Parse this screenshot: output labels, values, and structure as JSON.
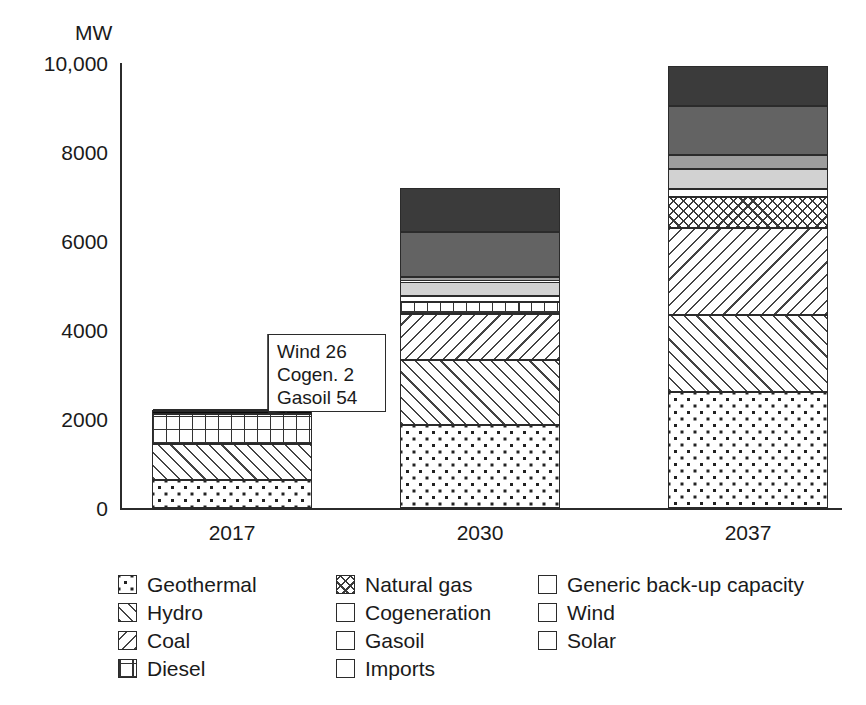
{
  "chart_data": {
    "type": "bar",
    "stacked": true,
    "title": "",
    "subtitle": "",
    "xlabel": "",
    "ylabel": "MW",
    "unit": "MW",
    "categories": [
      "2017",
      "2030",
      "2037"
    ],
    "ylim": [
      0,
      10000
    ],
    "yticks": [
      0,
      2000,
      4000,
      6000,
      8000,
      10000
    ],
    "ytick_labels": [
      "0",
      "2000",
      "4000",
      "6000",
      "8000",
      "10,000"
    ],
    "grid": false,
    "legend_position": "bottom",
    "totals": [
      2175,
      7190,
      9930
    ],
    "series": [
      {
        "name": "Geothermal",
        "pattern": "dots",
        "values": [
          620,
          1860,
          2600
        ]
      },
      {
        "name": "Hydro",
        "pattern": "diagonal-up",
        "values": [
          820,
          1460,
          1740
        ]
      },
      {
        "name": "Coal",
        "pattern": "diagonal-dn",
        "values": [
          0,
          1050,
          1950
        ]
      },
      {
        "name": "Diesel",
        "pattern": "grid",
        "values": [
          680,
          270,
          0
        ]
      },
      {
        "name": "Natural gas",
        "pattern": "crosshatch",
        "values": [
          0,
          0,
          700
        ]
      },
      {
        "name": "Cogeneration",
        "pattern": "white",
        "values": [
          2,
          120,
          180
        ]
      },
      {
        "name": "Gasoil",
        "pattern": "black",
        "values": [
          54,
          0,
          0
        ]
      },
      {
        "name": "Imports",
        "pattern": "light-gray",
        "values": [
          0,
          330,
          440
        ]
      },
      {
        "name": "Generic back-up capacity",
        "pattern": "mid-gray",
        "values": [
          0,
          110,
          320
        ]
      },
      {
        "name": "Wind",
        "pattern": "dark-gray",
        "values": [
          26,
          1000,
          1100
        ]
      },
      {
        "name": "Solar",
        "pattern": "darkest-gray",
        "values": [
          0,
          990,
          900
        ]
      }
    ],
    "annotations": [
      {
        "target_category": "2017",
        "lines": [
          "Wind 26",
          "Cogen. 2",
          "Gasoil 54"
        ]
      }
    ]
  },
  "axis": {
    "y_title": "MW",
    "y_tick_labels": [
      "10,000",
      "8000",
      "6000",
      "4000",
      "2000",
      "0"
    ],
    "x_tick_labels": [
      "2017",
      "2030",
      "2037"
    ]
  },
  "callout": {
    "line1": "Wind 26",
    "line2": "Cogen. 2",
    "line3": "Gasoil 54"
  },
  "legend": {
    "column1": [
      {
        "label": "Geothermal"
      },
      {
        "label": "Hydro"
      },
      {
        "label": "Coal"
      },
      {
        "label": "Diesel"
      }
    ],
    "column2": [
      {
        "label": "Natural gas"
      },
      {
        "label": "Cogeneration"
      },
      {
        "label": "Gasoil"
      },
      {
        "label": "Imports"
      }
    ],
    "column3": [
      {
        "label": "Generic back-up capacity"
      },
      {
        "label": "Wind"
      },
      {
        "label": "Solar"
      }
    ]
  },
  "colors": {
    "axis": "#2b2b2b",
    "text": "#1a1a1a",
    "gasoil": "#0d0d0d",
    "imports": "#d2d2d2",
    "generic_backup": "#9d9d9d",
    "wind": "#636363",
    "solar": "#3b3b3b",
    "background": "#ffffff"
  }
}
